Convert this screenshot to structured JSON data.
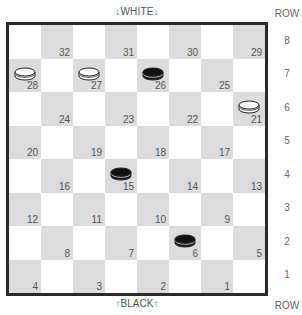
{
  "labels": {
    "top": "↓WHITE↓",
    "bottom": "↑BLACK↑",
    "row_header_top": "ROW",
    "row_header_bottom": "ROW"
  },
  "colors": {
    "dark_square": "#dcdcdc",
    "light_square": "#ffffff",
    "border": "#2a2a2a",
    "white_piece": "#ffffff",
    "black_piece": "#1a1a1a"
  },
  "rows": [
    {
      "row": "8",
      "squares": [
        {
          "dark": false
        },
        {
          "dark": true,
          "num": "32"
        },
        {
          "dark": false
        },
        {
          "dark": true,
          "num": "31"
        },
        {
          "dark": false
        },
        {
          "dark": true,
          "num": "30"
        },
        {
          "dark": false
        },
        {
          "dark": true,
          "num": "29"
        }
      ]
    },
    {
      "row": "7",
      "squares": [
        {
          "dark": true,
          "num": "28",
          "piece": "white"
        },
        {
          "dark": false
        },
        {
          "dark": true,
          "num": "27",
          "piece": "white"
        },
        {
          "dark": false
        },
        {
          "dark": true,
          "num": "26",
          "piece": "black"
        },
        {
          "dark": false
        },
        {
          "dark": true,
          "num": "25"
        },
        {
          "dark": false
        }
      ]
    },
    {
      "row": "6",
      "squares": [
        {
          "dark": false
        },
        {
          "dark": true,
          "num": "24"
        },
        {
          "dark": false
        },
        {
          "dark": true,
          "num": "23"
        },
        {
          "dark": false
        },
        {
          "dark": true,
          "num": "22"
        },
        {
          "dark": false
        },
        {
          "dark": true,
          "num": "21",
          "piece": "white"
        }
      ]
    },
    {
      "row": "5",
      "squares": [
        {
          "dark": true,
          "num": "20"
        },
        {
          "dark": false
        },
        {
          "dark": true,
          "num": "19"
        },
        {
          "dark": false
        },
        {
          "dark": true,
          "num": "18"
        },
        {
          "dark": false
        },
        {
          "dark": true,
          "num": "17"
        },
        {
          "dark": false
        }
      ]
    },
    {
      "row": "4",
      "squares": [
        {
          "dark": false
        },
        {
          "dark": true,
          "num": "16"
        },
        {
          "dark": false
        },
        {
          "dark": true,
          "num": "15",
          "piece": "black"
        },
        {
          "dark": false
        },
        {
          "dark": true,
          "num": "14"
        },
        {
          "dark": false
        },
        {
          "dark": true,
          "num": "13"
        }
      ]
    },
    {
      "row": "3",
      "squares": [
        {
          "dark": true,
          "num": "12"
        },
        {
          "dark": false
        },
        {
          "dark": true,
          "num": "11"
        },
        {
          "dark": false
        },
        {
          "dark": true,
          "num": "10"
        },
        {
          "dark": false
        },
        {
          "dark": true,
          "num": "9"
        },
        {
          "dark": false
        }
      ]
    },
    {
      "row": "2",
      "squares": [
        {
          "dark": false
        },
        {
          "dark": true,
          "num": "8"
        },
        {
          "dark": false
        },
        {
          "dark": true,
          "num": "7"
        },
        {
          "dark": false
        },
        {
          "dark": true,
          "num": "6",
          "piece": "black"
        },
        {
          "dark": false
        },
        {
          "dark": true,
          "num": "5"
        }
      ]
    },
    {
      "row": "1",
      "squares": [
        {
          "dark": true,
          "num": "4"
        },
        {
          "dark": false
        },
        {
          "dark": true,
          "num": "3"
        },
        {
          "dark": false
        },
        {
          "dark": true,
          "num": "2"
        },
        {
          "dark": false
        },
        {
          "dark": true,
          "num": "1"
        },
        {
          "dark": false
        }
      ]
    }
  ],
  "pieces": [
    {
      "square": "28",
      "color": "white"
    },
    {
      "square": "27",
      "color": "white"
    },
    {
      "square": "26",
      "color": "black"
    },
    {
      "square": "21",
      "color": "white"
    },
    {
      "square": "15",
      "color": "black"
    },
    {
      "square": "6",
      "color": "black"
    }
  ]
}
